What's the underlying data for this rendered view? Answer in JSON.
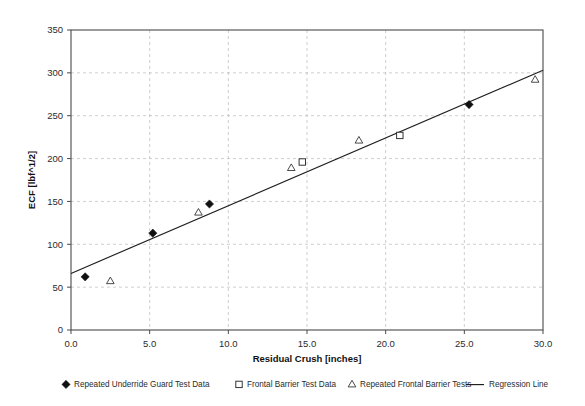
{
  "chart_data": {
    "type": "scatter",
    "title": "",
    "xlabel": "Residual Crush [inches]",
    "ylabel": "ECF [lbf^1/2]",
    "xlim": [
      0.0,
      30.0
    ],
    "ylim": [
      0,
      350
    ],
    "xticks": [
      "0.0",
      "5.0",
      "10.0",
      "15.0",
      "20.0",
      "25.0",
      "30.0"
    ],
    "xtick_values": [
      0,
      5,
      10,
      15,
      20,
      25,
      30
    ],
    "yticks": [
      "0",
      "50",
      "100",
      "150",
      "200",
      "250",
      "300",
      "350"
    ],
    "ytick_values": [
      0,
      50,
      100,
      150,
      200,
      250,
      300,
      350
    ],
    "grid": true,
    "legend_position": "bottom",
    "series": [
      {
        "name": "Repeated Underride Guard Test Data",
        "marker": "filled-diamond",
        "color": "#111111",
        "points": [
          {
            "x": 0.9,
            "y": 62
          },
          {
            "x": 5.2,
            "y": 113
          },
          {
            "x": 8.8,
            "y": 147
          },
          {
            "x": 25.3,
            "y": 263
          }
        ]
      },
      {
        "name": "Frontal Barrier Test Data",
        "marker": "open-square",
        "color": "#1f1f1f",
        "points": [
          {
            "x": 14.7,
            "y": 196
          },
          {
            "x": 20.9,
            "y": 227
          }
        ]
      },
      {
        "name": "Repeated Frontal Barrier Tests",
        "marker": "open-triangle",
        "color": "#2a2a2a",
        "points": [
          {
            "x": 2.5,
            "y": 57
          },
          {
            "x": 8.1,
            "y": 137
          },
          {
            "x": 14.0,
            "y": 189
          },
          {
            "x": 18.3,
            "y": 221
          },
          {
            "x": 29.5,
            "y": 292
          }
        ]
      },
      {
        "name": "Regression Line",
        "marker": "line",
        "color": "#1f1f1f",
        "line": {
          "x1": 0.0,
          "y1": 66,
          "x2": 30.0,
          "y2": 303
        }
      }
    ]
  },
  "legend": {
    "items": [
      {
        "label": "Repeated Underride Guard Test Data",
        "marker": "filled-diamond"
      },
      {
        "label": "Frontal Barrier Test Data",
        "marker": "open-square"
      },
      {
        "label": "Repeated Frontal Barrier Tests",
        "marker": "open-triangle"
      },
      {
        "label": "Regression Line",
        "marker": "line"
      }
    ]
  },
  "axes": {
    "x_title": "Residual Crush [inches]",
    "y_title": "ECF [lbf^1/2]"
  }
}
